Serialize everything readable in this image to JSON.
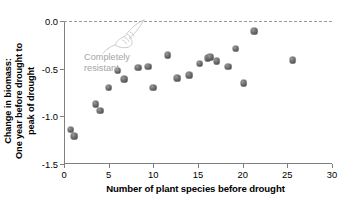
{
  "chart_data": {
    "type": "scatter",
    "title": "",
    "xlabel": "Number of plant species before drought",
    "ylabel": "Change in biomass: One year before drought to peak of drought",
    "ylabel_line1": "Change in biomass:",
    "ylabel_line2": "One year before drought to",
    "ylabel_line3": "peak of drought",
    "xlim": [
      0,
      30
    ],
    "ylim": [
      -1.5,
      0.0
    ],
    "xticks": [
      0,
      5,
      10,
      15,
      20,
      25,
      30
    ],
    "xticklabels": [
      "0",
      "5",
      "10",
      "15",
      "20",
      "25",
      "30"
    ],
    "yticks": [
      0.0,
      -0.5,
      -1.0,
      -1.5
    ],
    "yticklabels": [
      "0.0",
      "-0.5",
      "-1.0",
      "-1.5"
    ],
    "grid": false,
    "legend": "none",
    "reference_line": {
      "value": 0.0,
      "style": "dashed",
      "color": "#9a9a9a",
      "label": "Completely resistant"
    },
    "annotations": [
      {
        "text_line1": "Completely",
        "text_line2": "resistant",
        "color": "#a5a5a5",
        "points_to": "zero-line"
      }
    ],
    "marker_color": "#6e6e6e",
    "points": [
      {
        "x": 0.75,
        "y": -1.14
      },
      {
        "x": 1.15,
        "y": -1.21
      },
      {
        "x": 3.55,
        "y": -0.87
      },
      {
        "x": 4.05,
        "y": -0.94
      },
      {
        "x": 5.0,
        "y": -0.7
      },
      {
        "x": 6.0,
        "y": -0.52
      },
      {
        "x": 6.75,
        "y": -0.61
      },
      {
        "x": 8.3,
        "y": -0.49
      },
      {
        "x": 9.4,
        "y": -0.48
      },
      {
        "x": 10.0,
        "y": -0.7
      },
      {
        "x": 11.6,
        "y": -0.36
      },
      {
        "x": 12.7,
        "y": -0.6
      },
      {
        "x": 14.0,
        "y": -0.57
      },
      {
        "x": 15.2,
        "y": -0.45
      },
      {
        "x": 16.1,
        "y": -0.39
      },
      {
        "x": 16.35,
        "y": -0.38
      },
      {
        "x": 17.1,
        "y": -0.42
      },
      {
        "x": 18.4,
        "y": -0.48
      },
      {
        "x": 19.2,
        "y": -0.29
      },
      {
        "x": 20.1,
        "y": -0.65
      },
      {
        "x": 21.3,
        "y": -0.11
      },
      {
        "x": 25.6,
        "y": -0.41
      }
    ]
  }
}
